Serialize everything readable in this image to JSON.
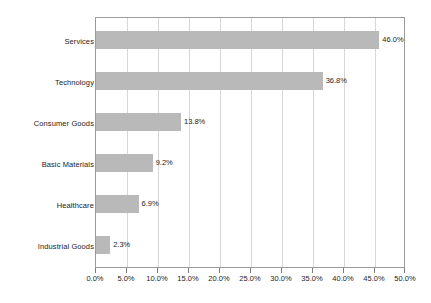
{
  "chart_data": {
    "type": "bar",
    "orientation": "horizontal",
    "title": "",
    "xlabel": "",
    "ylabel": "",
    "categories": [
      "Services",
      "Technology",
      "Consumer Goods",
      "Basic Materials",
      "Healthcare",
      "Industrial Goods"
    ],
    "values": [
      46.0,
      36.8,
      13.8,
      9.2,
      6.9,
      2.3
    ],
    "data_labels": [
      "46.0%",
      "36.8%",
      "13.8%",
      "9.2%",
      "6.9%",
      "2.3%"
    ],
    "xlim": [
      0,
      50
    ],
    "xticks": [
      0,
      5,
      10,
      15,
      20,
      25,
      30,
      35,
      40,
      45,
      50
    ],
    "xtick_labels": [
      "0.0%",
      "5.0%",
      "10.0%",
      "15.0%",
      "20.0%",
      "25.0%",
      "30.0%",
      "35.0%",
      "40.0%",
      "45.0%",
      "50.0%"
    ],
    "grid": "vertical",
    "legend": "none",
    "bar_color": "#b9b9b9",
    "border_color": "#9b9b9b",
    "gridline_color": "#d6d6d6",
    "text_color": "#1c1c1c"
  }
}
